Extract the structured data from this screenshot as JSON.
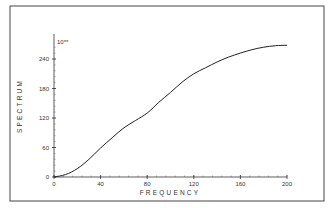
{
  "chart_data": {
    "type": "line",
    "title": "",
    "xlabel": "FREQUENCY",
    "ylabel": "SPECTRUM",
    "y_scale_marker": "10**",
    "xlim": [
      0,
      200
    ],
    "ylim": [
      0,
      270
    ],
    "grid": false,
    "legend": "none",
    "x_ticks": [
      0,
      40,
      80,
      120,
      160,
      200
    ],
    "x_tick_labels": [
      "0",
      "40",
      "80",
      "120",
      "160",
      "200"
    ],
    "y_ticks": [
      0,
      60,
      120,
      180,
      240
    ],
    "y_tick_labels": [
      "0",
      "60",
      "120",
      "180",
      "240"
    ],
    "series": [
      {
        "name": "spectrum",
        "x": [
          0,
          10,
          20,
          30,
          40,
          50,
          60,
          70,
          80,
          90,
          100,
          110,
          120,
          130,
          140,
          150,
          160,
          170,
          180,
          190,
          200
        ],
        "y": [
          0,
          5,
          17,
          36,
          59,
          80,
          100,
          115,
          130,
          152,
          172,
          193,
          210,
          222,
          234,
          244,
          252,
          259,
          264,
          267,
          268
        ]
      }
    ]
  }
}
